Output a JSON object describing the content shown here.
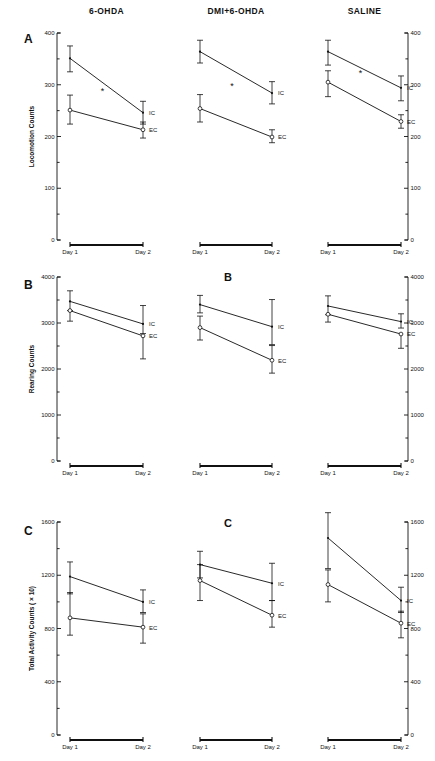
{
  "figure": {
    "panel_letters": [
      "A",
      "B",
      "C"
    ],
    "stray_labels": [
      "B",
      "C"
    ],
    "column_titles": [
      "6-OHDA",
      "DMI+6-OHDA",
      "SALINE"
    ],
    "x_tick_labels": [
      "Day 1",
      "Day 2"
    ],
    "series_labels": [
      "IC",
      "EC"
    ],
    "significance_marker": "*"
  },
  "chart_data": [
    {
      "type": "line",
      "panel": "A",
      "title": "6-OHDA",
      "ylabel": "Locomotion Counts",
      "xlabel": "",
      "x": [
        "Day 1",
        "Day 2"
      ],
      "ylim": [
        0,
        400
      ],
      "yticks": [
        0,
        100,
        200,
        300,
        400
      ],
      "yticklabels": [
        "0",
        "100",
        "200",
        "300",
        "400"
      ],
      "minor_ticks": true,
      "grid": false,
      "legend": "inline-right",
      "annotations": [
        "*"
      ],
      "series": [
        {
          "name": "IC",
          "values": [
            351,
            246
          ],
          "err_low": [
            26,
            22
          ],
          "err_high": [
            24,
            22
          ],
          "marker": "filled"
        },
        {
          "name": "EC",
          "values": [
            251,
            213
          ],
          "err_low": [
            27,
            16
          ],
          "err_high": [
            29,
            15
          ],
          "marker": "open"
        }
      ]
    },
    {
      "type": "line",
      "panel": "A",
      "title": "DMI+6-OHDA",
      "ylabel": "",
      "xlabel": "",
      "x": [
        "Day 1",
        "Day 2"
      ],
      "ylim": [
        0,
        400
      ],
      "yticks": [
        0,
        100,
        200,
        300,
        400
      ],
      "grid": false,
      "legend": "inline-right",
      "annotations": [
        "*"
      ],
      "series": [
        {
          "name": "IC",
          "values": [
            364,
            284
          ],
          "err_low": [
            22,
            21
          ],
          "err_high": [
            22,
            22
          ],
          "marker": "filled"
        },
        {
          "name": "EC",
          "values": [
            254,
            199
          ],
          "err_low": [
            26,
            11
          ],
          "err_high": [
            27,
            14
          ],
          "marker": "open"
        }
      ]
    },
    {
      "type": "line",
      "panel": "A",
      "title": "SALINE",
      "ylabel": "",
      "xlabel": "",
      "x": [
        "Day 1",
        "Day 2"
      ],
      "ylim": [
        0,
        400
      ],
      "yticks": [
        0,
        100,
        200,
        300,
        400
      ],
      "grid": false,
      "legend": "inline-right",
      "annotations": [
        "*"
      ],
      "series": [
        {
          "name": "IC",
          "values": [
            364,
            294
          ],
          "err_low": [
            26,
            25
          ],
          "err_high": [
            22,
            23
          ],
          "marker": "filled"
        },
        {
          "name": "EC",
          "values": [
            305,
            229
          ],
          "err_low": [
            28,
            13
          ],
          "err_high": [
            22,
            13
          ],
          "marker": "open"
        }
      ]
    },
    {
      "type": "line",
      "panel": "B",
      "title": "6-OHDA",
      "ylabel": "Rearing Counts",
      "xlabel": "",
      "x": [
        "Day 1",
        "Day 2"
      ],
      "ylim": [
        0,
        4000
      ],
      "yticks": [
        0,
        1000,
        2000,
        3000,
        4000
      ],
      "yticklabels": [
        "0",
        "1000",
        "2000",
        "3000",
        "4000"
      ],
      "grid": false,
      "legend": "inline-right",
      "series": [
        {
          "name": "IC",
          "values": [
            3470,
            2980
          ],
          "err_low": [
            200,
            210
          ],
          "err_high": [
            230,
            400
          ],
          "marker": "filled"
        },
        {
          "name": "EC",
          "values": [
            3270,
            2720
          ],
          "err_low": [
            230,
            500
          ],
          "err_high": [
            0,
            0
          ],
          "marker": "open"
        }
      ]
    },
    {
      "type": "line",
      "panel": "B",
      "title": "DMI+6-OHDA",
      "ylabel": "",
      "xlabel": "",
      "x": [
        "Day 1",
        "Day 2"
      ],
      "ylim": [
        0,
        4000
      ],
      "yticks": [
        0,
        1000,
        2000,
        3000,
        4000
      ],
      "grid": false,
      "legend": "inline-right",
      "series": [
        {
          "name": "IC",
          "values": [
            3400,
            2920
          ],
          "err_low": [
            180,
            390
          ],
          "err_high": [
            200,
            590
          ],
          "marker": "filled"
        },
        {
          "name": "EC",
          "values": [
            2900,
            2190
          ],
          "err_low": [
            270,
            280
          ],
          "err_high": [
            250,
            320
          ],
          "marker": "open"
        }
      ]
    },
    {
      "type": "line",
      "panel": "B",
      "title": "SALINE",
      "ylabel": "",
      "xlabel": "",
      "x": [
        "Day 1",
        "Day 2"
      ],
      "ylim": [
        0,
        4000
      ],
      "yticks": [
        0,
        1000,
        2000,
        3000,
        4000
      ],
      "grid": false,
      "legend": "inline-right",
      "series": [
        {
          "name": "IC",
          "values": [
            3370,
            3030
          ],
          "err_low": [
            190,
            140
          ],
          "err_high": [
            220,
            170
          ],
          "marker": "filled"
        },
        {
          "name": "EC",
          "values": [
            3190,
            2760
          ],
          "err_low": [
            170,
            310
          ],
          "err_high": [
            0,
            0
          ],
          "marker": "open"
        }
      ]
    },
    {
      "type": "line",
      "panel": "C",
      "title": "6-OHDA",
      "ylabel": "Total Activity Counts ( × 10)",
      "xlabel": "",
      "x": [
        "Day 1",
        "Day 2"
      ],
      "ylim": [
        0,
        1600
      ],
      "yticks": [
        0,
        400,
        800,
        1200,
        1600
      ],
      "yticklabels": [
        "0",
        "400",
        "800",
        "1200",
        "1600"
      ],
      "grid": false,
      "legend": "inline-right",
      "series": [
        {
          "name": "IC",
          "values": [
            1190,
            1000
          ],
          "err_low": [
            130,
            80
          ],
          "err_high": [
            110,
            90
          ],
          "marker": "filled"
        },
        {
          "name": "EC",
          "values": [
            880,
            810
          ],
          "err_low": [
            130,
            120
          ],
          "err_high": [
            190,
            100
          ],
          "marker": "open"
        }
      ]
    },
    {
      "type": "line",
      "panel": "C",
      "title": "DMI+6-OHDA",
      "ylabel": "",
      "xlabel": "",
      "x": [
        "Day 1",
        "Day 2"
      ],
      "ylim": [
        0,
        1600
      ],
      "yticks": [
        0,
        400,
        800,
        1200,
        1600
      ],
      "grid": false,
      "legend": "inline-right",
      "series": [
        {
          "name": "IC",
          "values": [
            1280,
            1140
          ],
          "err_low": [
            100,
            130
          ],
          "err_high": [
            100,
            150
          ],
          "marker": "filled"
        },
        {
          "name": "EC",
          "values": [
            1160,
            900
          ],
          "err_low": [
            150,
            90
          ],
          "err_high": [
            120,
            110
          ],
          "marker": "open"
        }
      ]
    },
    {
      "type": "line",
      "panel": "C",
      "title": "SALINE",
      "ylabel": "",
      "xlabel": "",
      "x": [
        "Day 1",
        "Day 2"
      ],
      "ylim": [
        0,
        1600
      ],
      "yticks": [
        0,
        400,
        800,
        1200,
        1600
      ],
      "grid": false,
      "legend": "inline-right",
      "series": [
        {
          "name": "IC",
          "values": [
            1480,
            1010
          ],
          "err_low": [
            230,
            90
          ],
          "err_high": [
            190,
            100
          ],
          "marker": "filled"
        },
        {
          "name": "EC",
          "values": [
            1130,
            840
          ],
          "err_low": [
            130,
            110
          ],
          "err_high": [
            110,
            90
          ],
          "marker": "open"
        }
      ]
    }
  ]
}
